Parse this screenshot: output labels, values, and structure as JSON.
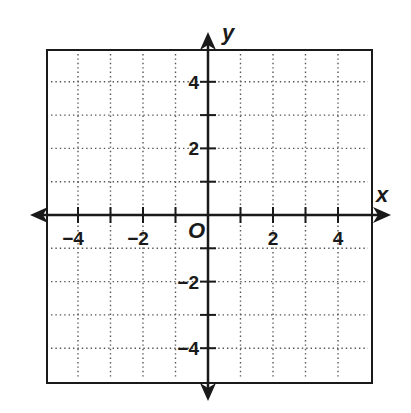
{
  "chart_data": {
    "type": "scatter",
    "title": "",
    "xlabel": "x",
    "ylabel": "y",
    "origin_label": "O",
    "xlim": [
      -5,
      5
    ],
    "ylim": [
      -5,
      5
    ],
    "grid": true,
    "grid_style": "dotted",
    "grid_step": 1,
    "x_tick_labels": [
      {
        "value": -4,
        "label": "−4"
      },
      {
        "value": -2,
        "label": "−2"
      },
      {
        "value": 2,
        "label": "2"
      },
      {
        "value": 4,
        "label": "4"
      }
    ],
    "y_tick_labels": [
      {
        "value": 4,
        "label": "4"
      },
      {
        "value": 2,
        "label": "2"
      },
      {
        "value": -2,
        "label": "−2"
      },
      {
        "value": -4,
        "label": "−4"
      }
    ],
    "series": [],
    "legend": null
  },
  "colors": {
    "ink": "#1a1a1a",
    "grid": "#555555",
    "background": "#ffffff"
  }
}
